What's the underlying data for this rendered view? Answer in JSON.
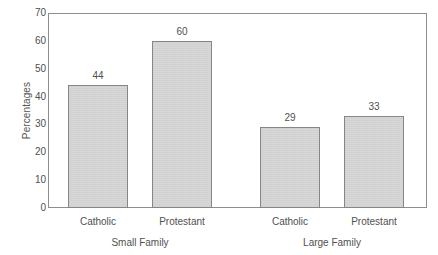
{
  "chart_data": {
    "type": "bar",
    "title": "",
    "xlabel": "",
    "ylabel": "Percentages",
    "ylim": [
      0,
      70
    ],
    "yticks": [
      0,
      10,
      20,
      30,
      40,
      50,
      60,
      70
    ],
    "grid": false,
    "legend": "none",
    "categories": [
      "Catholic",
      "Protestant",
      "Catholic",
      "Protestant"
    ],
    "groups": [
      "Small Family",
      "Large Family"
    ],
    "values": [
      44,
      60,
      29,
      33
    ],
    "bars": [
      {
        "label": "Catholic",
        "group": "Small Family",
        "value": 44,
        "value_text": "44"
      },
      {
        "label": "Protestant",
        "group": "Small Family",
        "value": 60,
        "value_text": "60"
      },
      {
        "label": "Catholic",
        "group": "Large Family",
        "value": 29,
        "value_text": "29"
      },
      {
        "label": "Protestant",
        "group": "Large Family",
        "value": 33,
        "value_text": "33"
      }
    ],
    "ytick_labels": [
      "70",
      "60",
      "50",
      "40",
      "30",
      "20",
      "10",
      "0"
    ],
    "colors": {
      "bar_fill": "#d7d7d7",
      "bar_border": "#868686",
      "axis": "#8d8d8d",
      "text": "#4f4f4f",
      "background": "#ffffff"
    }
  }
}
